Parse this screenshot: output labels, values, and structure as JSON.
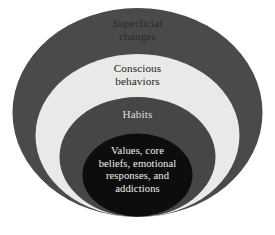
{
  "diagram": {
    "type": "concentric-nested-ellipses",
    "title": "",
    "background_color": "#ffffff",
    "layers": [
      {
        "id": "superficial",
        "label": "Superficial\nchanges",
        "fill_color": "#4a4a4a",
        "text_color": "#2b2b2b",
        "level": 1,
        "position": "outermost"
      },
      {
        "id": "conscious",
        "label": "Conscious\nbehaviors",
        "fill_color": "#e9e9e7",
        "text_color": "#1c1c1c",
        "level": 2,
        "position": "second"
      },
      {
        "id": "habits",
        "label": "Habits",
        "fill_color": "#464646",
        "text_color": "#dcdcdc",
        "level": 3,
        "position": "third"
      },
      {
        "id": "core",
        "label": "Values, core\nbeliefs, emotional\nresponses, and\naddictions",
        "fill_color": "#0d0d0d",
        "text_color": "#f2f2f0",
        "level": 4,
        "position": "innermost"
      }
    ]
  }
}
